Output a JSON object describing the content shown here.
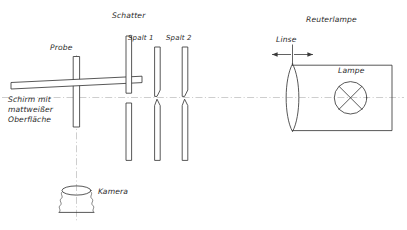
{
  "figure": {
    "language": "de",
    "background_color": "#ffffff",
    "ink_color": "#3a3a3a",
    "axis_color": "#b9b9b9",
    "width": 407,
    "height": 230
  },
  "labels": {
    "probe": "Probe",
    "screen": "Schirm mit\nmattweißer\nOberfläche",
    "screen_line1": "Schirm mit",
    "screen_line2": "mattweißer",
    "screen_line3": "Oberfläche",
    "camera": "Kamera",
    "shutter": "Schatter",
    "slit1": "Spalt 1",
    "slit2": "Spalt 2",
    "lamp_assembly": "Reuterlampe",
    "lens": "Linse",
    "lamp": "Lampe"
  },
  "components": [
    {
      "name": "probe",
      "label": "Probe",
      "kind": "vertical-rod"
    },
    {
      "name": "screen",
      "label": "Schirm mit mattweißer Oberfläche",
      "kind": "tilted-plate"
    },
    {
      "name": "camera",
      "label": "Kamera",
      "kind": "bellows-camera"
    },
    {
      "name": "shutter",
      "label": "Schatter",
      "kind": "aperture-bars"
    },
    {
      "name": "slit-1",
      "label": "Spalt 1",
      "kind": "slit-bars"
    },
    {
      "name": "slit-2",
      "label": "Spalt 2",
      "kind": "slit-bars"
    },
    {
      "name": "lens",
      "label": "Linse",
      "kind": "biconvex-lens"
    },
    {
      "name": "lamp",
      "label": "Lampe",
      "kind": "crossed-circle"
    },
    {
      "name": "lamp-housing",
      "label": "Reuterlampe",
      "kind": "open-box"
    }
  ],
  "icons": {
    "lamp_symbol": "crossed-circle-icon",
    "lens_symbol": "biconvex-lens-icon",
    "camera_symbol": "bellows-camera-icon",
    "axis_symbol": "optical-axis-icon",
    "arrow_symbol": "double-arrow-icon"
  }
}
